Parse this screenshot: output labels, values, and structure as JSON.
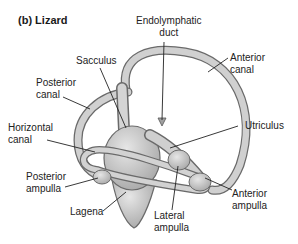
{
  "figure": {
    "title": "(b) Lizard",
    "labels": {
      "endolymphatic_duct": "Endolymphatic\nduct",
      "sacculus": "Sacculus",
      "anterior_canal": "Anterior\ncanal",
      "posterior_canal": "Posterior\ncanal",
      "horizontal_canal": "Horizontal\ncanal",
      "utriculus": "Utriculus",
      "posterior_ampulla": "Posterior\nampulla",
      "anterior_ampulla": "Anterior\nampulla",
      "lagena": "Lagena",
      "lateral_ampulla": "Lateral\nampulla"
    },
    "colors": {
      "structure_fill": "#d4d4d4",
      "structure_stroke": "#6a6a6a",
      "leader_line": "#222222",
      "text": "#222222"
    }
  }
}
